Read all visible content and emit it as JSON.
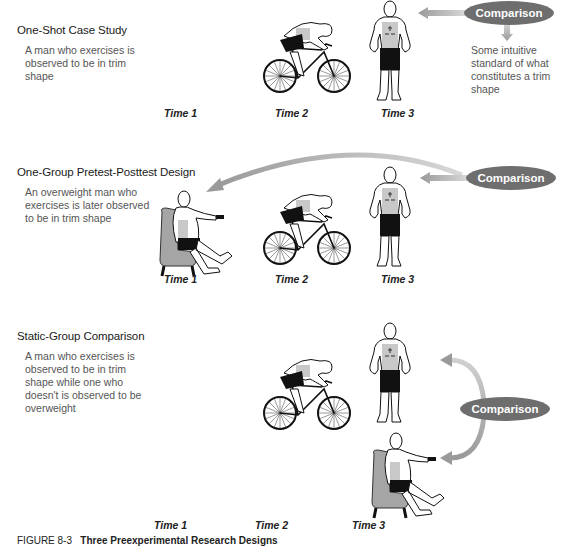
{
  "figure": {
    "caption_label": "FIGURE 8-3",
    "caption_title": "Three Preexperimental Research Designs"
  },
  "panels": [
    {
      "title": "One-Shot Case Study",
      "description": "A man who exercises is observed to be in trim shape",
      "times": [
        "Time 1",
        "Time 2",
        "Time 3"
      ],
      "comparison_label": "Comparison",
      "comparison_note": "Some intuitive standard of what constitutes a trim shape",
      "figures": [
        "cyclist",
        "standing-trim-man"
      ]
    },
    {
      "title": "One-Group Pretest-Posttest Design",
      "description": "An overweight man who exercises is later observed to be in trim shape",
      "times": [
        "Time 1",
        "Time 2",
        "Time 3"
      ],
      "comparison_label": "Comparison",
      "figures": [
        "seated-overweight-man",
        "cyclist",
        "standing-trim-man"
      ]
    },
    {
      "title": "Static-Group Comparison",
      "description": "A man who exercises is observed to be in trim shape while one who doesn't is observed to be overweight",
      "times": [
        "Time 1",
        "Time 2",
        "Time 3"
      ],
      "comparison_label": "Comparison",
      "figures": [
        "cyclist",
        "standing-trim-man",
        "seated-overweight-man"
      ]
    }
  ],
  "colors": {
    "comparison_fill": "#6e6e6e",
    "arrow_fill": "#b8b8b8",
    "chair_fill": "#a5a5a5",
    "torso_fill": "#c8c8c8"
  }
}
